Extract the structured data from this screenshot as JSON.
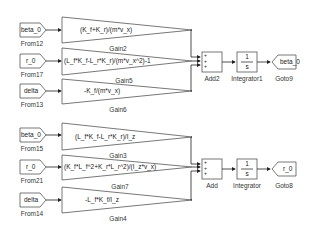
{
  "diagram": {
    "top_group": {
      "froms": [
        {
          "tag": "beta_0",
          "name": "From12"
        },
        {
          "tag": "r_0",
          "name": "From17"
        },
        {
          "tag": "delta",
          "name": "From13"
        }
      ],
      "gains": [
        {
          "expr": "(K_f+K_r)/(m*v_x)",
          "name": "Gain2"
        },
        {
          "expr": "(L_f*K_f-L_r*K_r)/(m*v_x^2)-1",
          "name": "Gain5"
        },
        {
          "expr": "-K_f/(m*v_x)",
          "name": "Gain6"
        }
      ],
      "add": {
        "name": "Add2",
        "signs": [
          "+",
          "+",
          "+"
        ]
      },
      "integrator": {
        "name": "Integrator1",
        "num": "1",
        "den": "s"
      },
      "goto": {
        "tag": "beta_0",
        "name": "Goto9"
      }
    },
    "bottom_group": {
      "froms": [
        {
          "tag": "beta_0",
          "name": "From15"
        },
        {
          "tag": "r_0",
          "name": "From21"
        },
        {
          "tag": "delta",
          "name": "From14"
        }
      ],
      "gains": [
        {
          "expr": "(L_f*K_f-L_r*K_r)/I_z",
          "name": "Gain3"
        },
        {
          "expr": "(K_f*L_f^2+K_r*L_r^2)/(I_z*v_x)",
          "name": "Gain7"
        },
        {
          "expr": "-L_f*K_f/I_z",
          "name": "Gain4"
        }
      ],
      "add": {
        "name": "Add",
        "signs": [
          "+",
          "+",
          "+"
        ]
      },
      "integrator": {
        "name": "Integrator",
        "num": "1",
        "den": "s"
      },
      "goto": {
        "tag": "r_0",
        "name": "Goto8"
      }
    }
  }
}
